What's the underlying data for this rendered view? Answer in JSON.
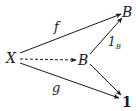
{
  "diagram": {
    "type": "commutative-diagram",
    "nodes": [
      {
        "id": "X",
        "label": "X",
        "x": 12,
        "y": 58
      },
      {
        "id": "B_mid",
        "label": "B",
        "x": 84,
        "y": 60
      },
      {
        "id": "B_top",
        "label": "B",
        "x": 127,
        "y": 12
      },
      {
        "id": "one",
        "label": "1",
        "x": 126,
        "y": 102
      }
    ],
    "edges": [
      {
        "from": "X",
        "to": "B_top",
        "label": "f",
        "style": "solid"
      },
      {
        "from": "X",
        "to": "B_mid",
        "label": "",
        "style": "dashed"
      },
      {
        "from": "B_mid",
        "to": "B_top",
        "label": "1",
        "label_sub": "B",
        "style": "solid"
      },
      {
        "from": "B_mid",
        "to": "one",
        "label": "",
        "style": "solid"
      },
      {
        "from": "X",
        "to": "one",
        "label": "g",
        "style": "solid"
      }
    ],
    "stroke_color": "#1a1a1a"
  }
}
